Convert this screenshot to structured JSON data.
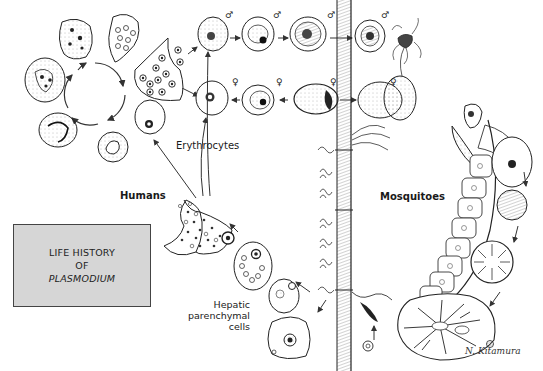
{
  "title_box": {
    "line1": "LIFE HISTORY",
    "line2": "OF",
    "line3": "PLASMODIUM",
    "background": "#d6d6d6",
    "border": "#444444"
  },
  "labels": {
    "humans": "Humans",
    "mosquitoes": "Mosquitoes",
    "erythrocytes": "Erythrocytes",
    "hepatic_line1": "Hepatic",
    "hepatic_line2": "parenchymal",
    "hepatic_line3": "cells"
  },
  "symbols": {
    "male": "♂",
    "female": "♀"
  },
  "signature": "N. Kitamura",
  "colors": {
    "ink": "#1a1a1a",
    "background": "#ffffff",
    "stipple": "#555555"
  }
}
